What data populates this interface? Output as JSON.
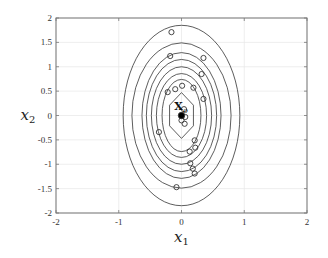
{
  "chart_data": {
    "type": "scatter",
    "title": "",
    "xlabel": "x1",
    "ylabel": "x2",
    "xlabel_main": "x",
    "xlabel_sub": "1",
    "ylabel_main": "x",
    "ylabel_sub": "2",
    "xlim": [
      -2,
      2
    ],
    "ylim": [
      -2,
      2
    ],
    "xticks": [
      -2,
      -1,
      0,
      1,
      2
    ],
    "yticks": [
      -2,
      -1.5,
      -1,
      -0.5,
      0,
      0.5,
      1,
      1.5,
      2
    ],
    "xtick_labels": [
      "-2",
      "-1",
      "0",
      "1",
      "2"
    ],
    "ytick_labels": [
      "-2",
      "-1.5",
      "-1",
      "-0.5",
      "0",
      "0.5",
      "1",
      "1.5",
      "2"
    ],
    "grid": true,
    "legend": null,
    "contours": {
      "center": [
        0,
        0
      ],
      "shape": "ellipse",
      "levels": [
        {
          "rx": 0.93,
          "ry": 1.85
        },
        {
          "rx": 0.79,
          "ry": 1.49
        },
        {
          "rx": 0.63,
          "ry": 1.29
        },
        {
          "rx": 0.56,
          "ry": 1.15
        },
        {
          "rx": 0.48,
          "ry": 1.0
        },
        {
          "rx": 0.4,
          "ry": 0.86
        },
        {
          "rx": 0.31,
          "ry": 0.74
        },
        {
          "rx": 0.19,
          "ry": 0.47
        }
      ]
    },
    "series": [
      {
        "name": "samples",
        "marker": "open-circle",
        "points": [
          [
            -0.16,
            1.71
          ],
          [
            -0.18,
            1.22
          ],
          [
            0.35,
            1.18
          ],
          [
            0.32,
            0.85
          ],
          [
            -0.22,
            0.48
          ],
          [
            -0.1,
            0.54
          ],
          [
            0.01,
            0.61
          ],
          [
            0.19,
            0.57
          ],
          [
            0.35,
            0.34
          ],
          [
            0.04,
            0.13
          ],
          [
            0.06,
            -0.03
          ],
          [
            0.0,
            -0.1
          ],
          [
            0.05,
            -0.17
          ],
          [
            -0.36,
            -0.34
          ],
          [
            0.21,
            -0.51
          ],
          [
            0.22,
            -0.66
          ],
          [
            0.13,
            -0.74
          ],
          [
            0.14,
            -0.98
          ],
          [
            0.18,
            -1.09
          ],
          [
            0.21,
            -1.19
          ],
          [
            -0.08,
            -1.47
          ]
        ]
      },
      {
        "name": "x0",
        "marker": "filled-circle",
        "points": [
          [
            0,
            0
          ]
        ]
      }
    ],
    "annotations": [
      {
        "text_main": "X",
        "text_sub": "o",
        "x": -0.05,
        "y": 0.2
      }
    ]
  },
  "colors": {
    "axis": "#777777",
    "grid": "#e6e6e6",
    "contour": "#333333",
    "marker": "#333333"
  }
}
